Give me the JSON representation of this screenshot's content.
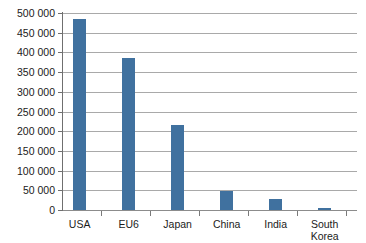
{
  "chart_data": {
    "type": "bar",
    "title": "",
    "subtitle": "",
    "xlabel": "",
    "ylabel": "",
    "categories": [
      "USA",
      "EU6",
      "Japan",
      "China",
      "India",
      "South\nKorea"
    ],
    "values": [
      486000,
      385000,
      217000,
      47000,
      29000,
      5000
    ],
    "series": [
      {
        "name": "",
        "values": [
          486000,
          385000,
          217000,
          47000,
          29000,
          5000
        ]
      }
    ],
    "ylim": [
      0,
      500000
    ],
    "ytick_values": [
      0,
      50000,
      100000,
      150000,
      200000,
      250000,
      300000,
      350000,
      400000,
      450000,
      500000
    ],
    "ytick_labels": [
      "0",
      "50 000",
      "100 000",
      "150 000",
      "200 000",
      "250 000",
      "300 000",
      "350 000",
      "400 000",
      "450 000",
      "500 000"
    ],
    "grid": true,
    "grid_axis": "y",
    "legend": false,
    "legend_position": "none",
    "bar_color": "#40719f",
    "grid_color": "#a9a9a9",
    "axis_color": "#6f6f6f",
    "background_color": "#ffffff",
    "text_color": "#1b1b1b"
  }
}
